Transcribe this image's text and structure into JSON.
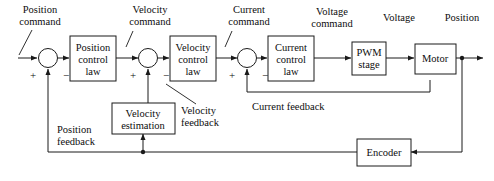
{
  "diagram": {
    "stroke_color": "#1a1a1a",
    "background_color": "#ffffff",
    "blocks": [
      {
        "id": "position_control_law",
        "lines": [
          "Position",
          "control",
          "law"
        ]
      },
      {
        "id": "velocity_control_law",
        "lines": [
          "Velocity",
          "control",
          "law"
        ]
      },
      {
        "id": "current_control_law",
        "lines": [
          "Current",
          "control",
          "law"
        ]
      },
      {
        "id": "pwm_stage",
        "lines": [
          "PWM",
          "stage"
        ]
      },
      {
        "id": "motor",
        "lines": [
          "Motor"
        ]
      },
      {
        "id": "velocity_estimation",
        "lines": [
          "Velocity",
          "estimation"
        ]
      },
      {
        "id": "encoder",
        "lines": [
          "Encoder"
        ]
      }
    ],
    "signal_labels": [
      {
        "id": "position_command",
        "lines": [
          "Position",
          "command"
        ]
      },
      {
        "id": "velocity_command",
        "lines": [
          "Velocity",
          "command"
        ]
      },
      {
        "id": "current_command",
        "lines": [
          "Current",
          "command"
        ]
      },
      {
        "id": "voltage_command",
        "lines": [
          "Voltage",
          "command"
        ]
      },
      {
        "id": "voltage",
        "lines": [
          "Voltage"
        ]
      },
      {
        "id": "position",
        "lines": [
          "Position"
        ]
      }
    ],
    "feedback_labels": [
      {
        "id": "velocity_feedback",
        "lines": [
          "Velocity",
          "feedback"
        ]
      },
      {
        "id": "current_feedback",
        "lines": [
          "Current feedback"
        ]
      },
      {
        "id": "position_feedback",
        "lines": [
          "Position",
          "feedback"
        ]
      }
    ],
    "summing_junctions": [
      {
        "id": "position_error",
        "plus": "+",
        "minus": "−"
      },
      {
        "id": "velocity_error",
        "plus": "+",
        "minus": "−"
      },
      {
        "id": "current_error",
        "plus": "+",
        "minus": "−"
      }
    ]
  }
}
